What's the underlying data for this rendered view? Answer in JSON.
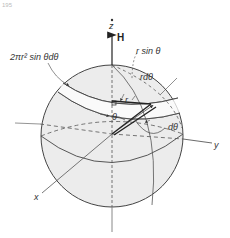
{
  "figure": {
    "corner_text": "195",
    "labels": {
      "ring_area": "2πr² sin θdθ",
      "r_sin_theta": "r sin θ",
      "r_dtheta": "rdθ",
      "r": "r",
      "theta": "θ",
      "d_theta": "dθ",
      "z_axis": "z",
      "field": "H",
      "y_axis": "y",
      "x_axis": "x"
    },
    "colors": {
      "sphere_fill": "#ececec",
      "line": "#444444",
      "dashed": "#555555",
      "background": "#ffffff"
    }
  }
}
